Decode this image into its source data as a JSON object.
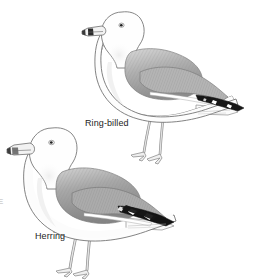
{
  "plate": {
    "width": 254,
    "height": 280,
    "background_color": "#ffffff",
    "style": "grayscale field-guide illustration",
    "edge_caption": "E"
  },
  "birds": [
    {
      "id": "ring-billed",
      "label": "Ring-billed",
      "position": "upper-right",
      "facing": "left",
      "features": {
        "bill": "pale with dark subterminal ring",
        "mantle_color": "#9a9a9a",
        "wingtip": "black with white mirrors",
        "leg_color": "#c9c9c9",
        "body_color": "#fbfbfb"
      }
    },
    {
      "id": "herring",
      "label": "Herring",
      "position": "lower-left",
      "facing": "left",
      "features": {
        "bill": "heavy, pale with dark tip smudge",
        "mantle_color": "#8f8f8f",
        "wingtip": "bold black chevrons with white mirrors",
        "leg_color": "#cccccc",
        "body_color": "#fcfcfc"
      }
    }
  ],
  "colors": {
    "outline": "#6e6e6e",
    "dark_outline": "#4a4a4a",
    "mantle_light": "#cfcfcf",
    "mantle_mid": "#a6a6a6",
    "mantle_dark": "#7d7d7d",
    "black": "#1a1a1a",
    "text": "#242424",
    "white": "#ffffff"
  }
}
